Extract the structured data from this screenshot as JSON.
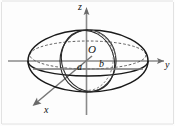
{
  "figure": {
    "background_color": "#fdfdfd",
    "curve_color": "#1a1a1a",
    "axis_color": "#8a8a8a",
    "label_color": "#111111"
  },
  "axes": {
    "z": {
      "label": "z",
      "direction": "up",
      "arrow": true
    },
    "y": {
      "label": "y",
      "direction": "right",
      "arrow": true
    },
    "x": {
      "label": "x",
      "direction": "down-left",
      "arrow": true
    }
  },
  "labels": {
    "origin": "O",
    "semi_axis_a": "a",
    "semi_axis_b": "b"
  },
  "geometry": {
    "outer_ellipse": {
      "cx": 88,
      "cy": 61,
      "rx": 60,
      "ry": 31
    },
    "vertical_ellipse": {
      "cx": 88,
      "cy": 61,
      "rx": 28,
      "ry": 31
    },
    "equator_dashed": {
      "cx": 88,
      "cy": 55,
      "rx": 60,
      "ry": 14
    },
    "slant_ellipse": {
      "cx": 88,
      "cy": 61,
      "rx": 26,
      "ry": 31,
      "rotation": -22
    }
  }
}
